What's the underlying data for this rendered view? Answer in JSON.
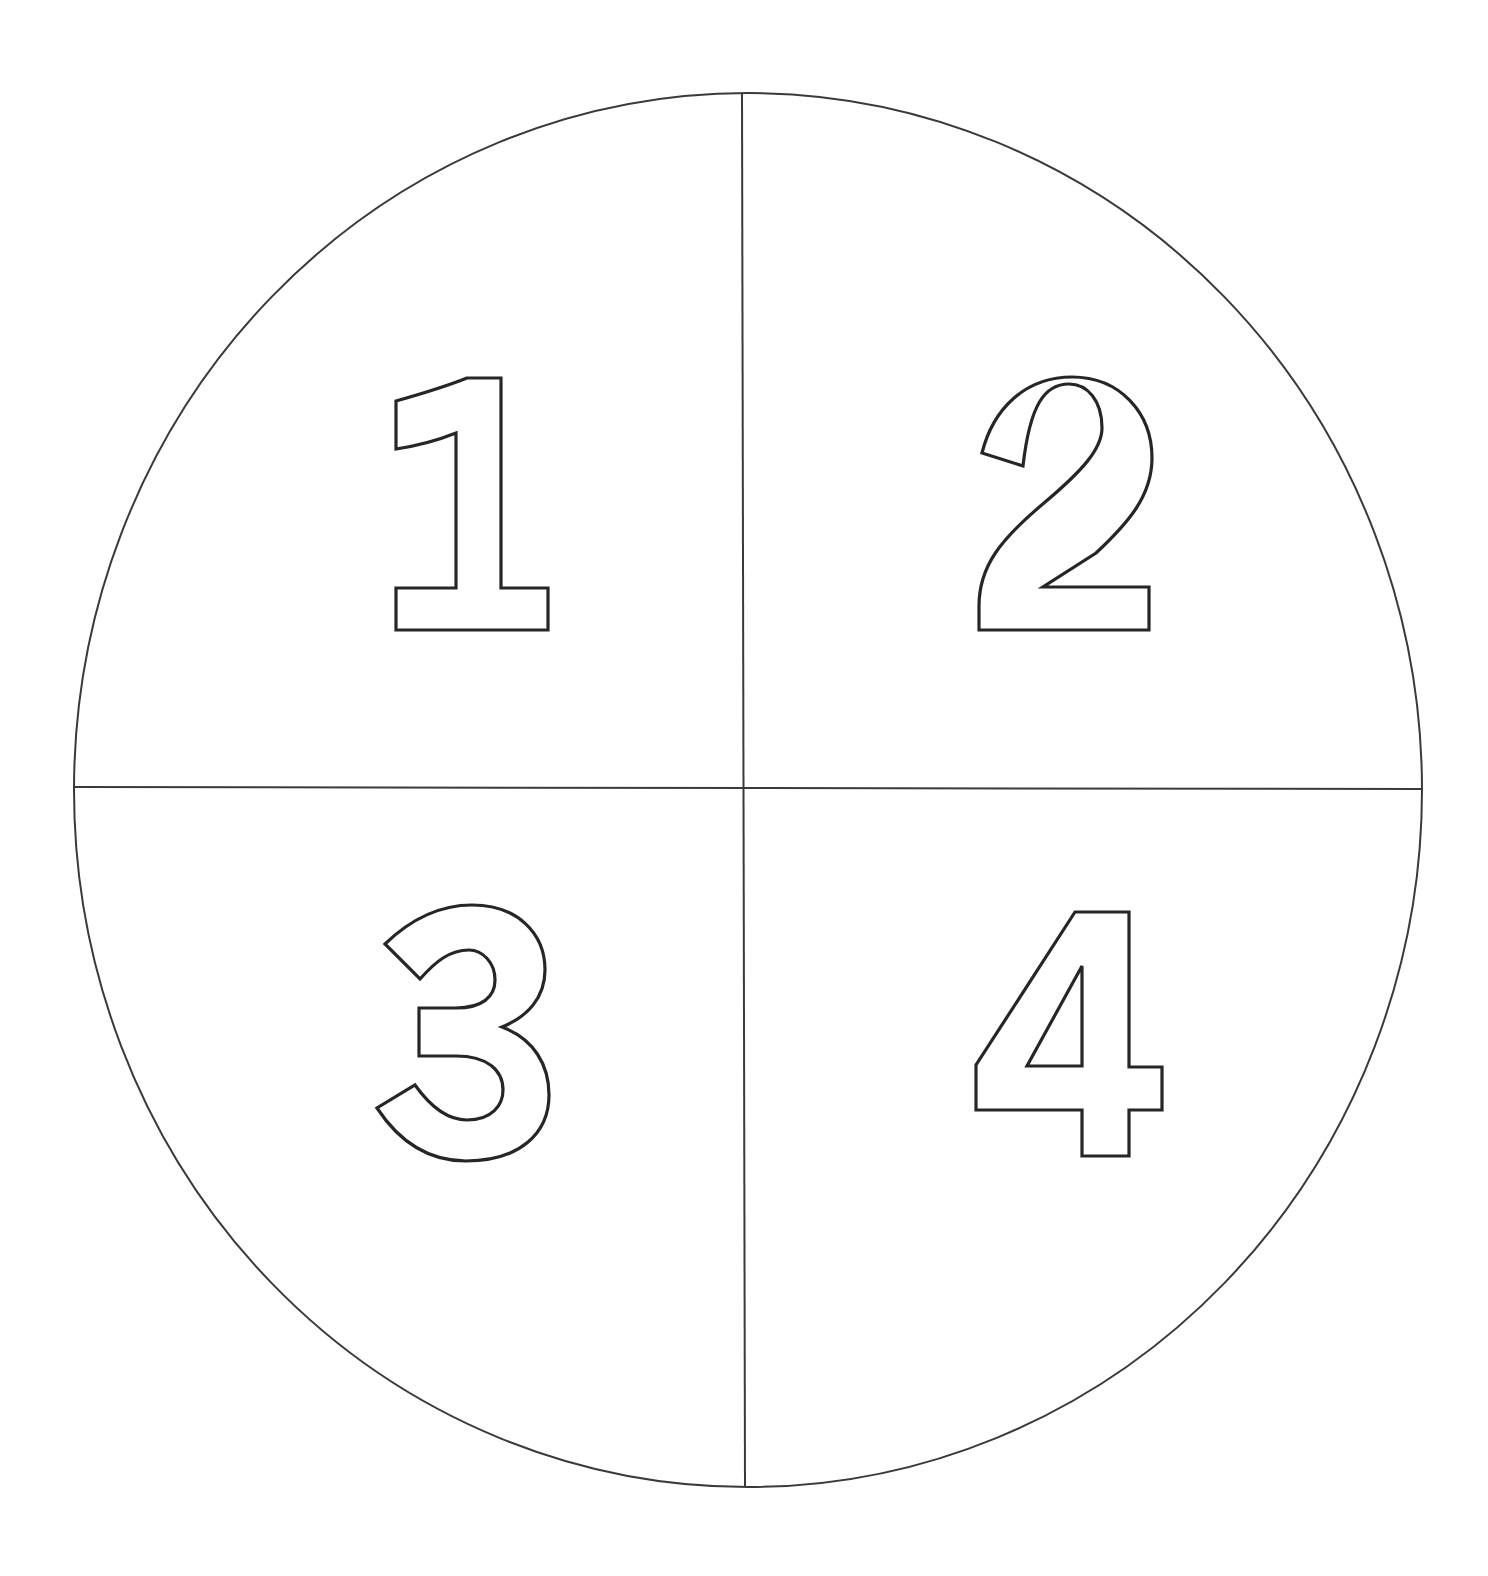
{
  "diagram": {
    "type": "circle-divided-into-quadrants",
    "colors": {
      "background": "#ffffff",
      "stroke": "#262626"
    },
    "quadrants": [
      {
        "position": "top-left",
        "label": "1"
      },
      {
        "position": "top-right",
        "label": "2"
      },
      {
        "position": "bottom-left",
        "label": "3"
      },
      {
        "position": "bottom-right",
        "label": "4"
      }
    ]
  }
}
